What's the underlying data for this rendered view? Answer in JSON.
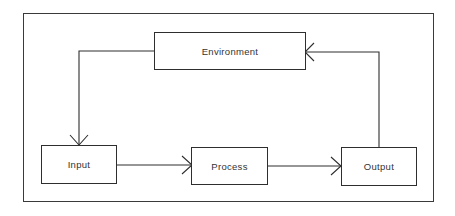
{
  "diagram": {
    "type": "system feedback loop",
    "nodes": [
      {
        "id": "environment",
        "label": "Environment"
      },
      {
        "id": "input",
        "label": "Input"
      },
      {
        "id": "process",
        "label": "Process"
      },
      {
        "id": "output",
        "label": "Output"
      }
    ],
    "edges": [
      {
        "from": "environment",
        "to": "input"
      },
      {
        "from": "input",
        "to": "process"
      },
      {
        "from": "process",
        "to": "output"
      },
      {
        "from": "output",
        "to": "environment"
      }
    ],
    "colors": {
      "line": "#2e2e2e",
      "text": "#333333",
      "background": "#ffffff"
    }
  }
}
